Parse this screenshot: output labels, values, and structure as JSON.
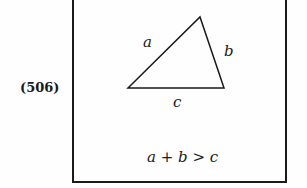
{
  "equation_number": "(506)",
  "triangle": {
    "vertices": [
      [
        128,
        88
      ],
      [
        200,
        17
      ],
      [
        224,
        88
      ]
    ],
    "labels": {
      "a": "a",
      "b": "b",
      "c": "c"
    }
  },
  "inequality": {
    "lhs_a": "a",
    "plus": "+",
    "lhs_b": "b",
    "op": ">",
    "rhs": "c"
  },
  "colors": {
    "stroke": "#1a1a1a",
    "background": "#fefefe"
  }
}
